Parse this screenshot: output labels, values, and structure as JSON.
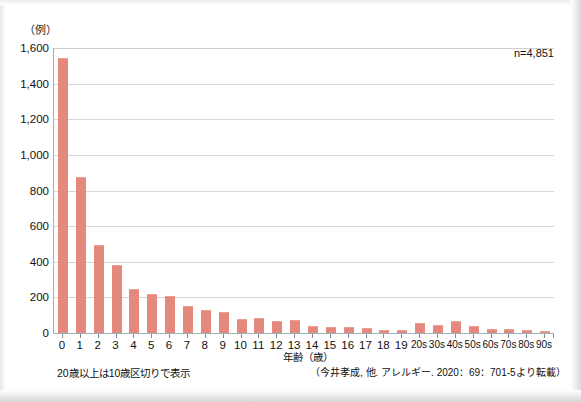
{
  "chart_data": {
    "type": "bar",
    "title": "",
    "subtitle": "",
    "unit_label": "（例）",
    "xlabel": "年齢（歳）",
    "ylabel": "",
    "ylim": [
      0,
      1600
    ],
    "ytick_step": 200,
    "grid": true,
    "legend": null,
    "annotation_n": "n=4,851",
    "footnote_left": "20歳以上は10歳区切りで表示",
    "footnote_right": "（今井孝成, 他. アレルギー. 2020：69：701-5より転載）",
    "bar_color": "#e5897d",
    "categories": [
      "0",
      "1",
      "2",
      "3",
      "4",
      "5",
      "6",
      "7",
      "8",
      "9",
      "10",
      "11",
      "12",
      "13",
      "14",
      "15",
      "16",
      "17",
      "18",
      "19",
      "20s",
      "30s",
      "40s",
      "50s",
      "60s",
      "70s",
      "80s",
      "90s"
    ],
    "values": [
      1540,
      870,
      490,
      375,
      240,
      215,
      200,
      145,
      125,
      115,
      75,
      80,
      60,
      65,
      35,
      30,
      28,
      20,
      12,
      10,
      48,
      42,
      62,
      35,
      18,
      15,
      12,
      3
    ],
    "ytick_labels": [
      "0",
      "200",
      "400",
      "600",
      "800",
      "1,000",
      "1,200",
      "1,400",
      "1,600"
    ],
    "ytick_values": [
      0,
      200,
      400,
      600,
      800,
      1000,
      1200,
      1400,
      1600
    ]
  }
}
